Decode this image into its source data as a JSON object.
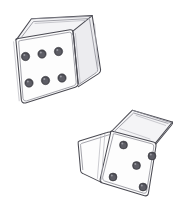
{
  "artwork": {
    "title": "Two Dice Pencil Sketch",
    "medium": "pencil-sketch",
    "background_color": "#ffffff",
    "ink_color": "#4a4a52",
    "soft_ink_color": "#8d8d96",
    "pip_color": "#4b4b52",
    "width": 185,
    "height": 222
  },
  "dice": [
    {
      "id": "die-upper-left",
      "value_shown": 6,
      "face_label": "six",
      "pip_layout": "two-rows-of-three",
      "front_face_fill": "#fdfdfd",
      "top_face_fill": "#f4f4f6",
      "side_face_fill": "#ececef",
      "front_outline": "14,40 72,30 78,86 22,103",
      "top_outline": "14,40 30,18 92,15 72,30",
      "side_outline": "72,30 92,15 100,70 78,86",
      "pips": [
        {
          "cx": 25.5,
          "cy": 56.5,
          "r": 4.2
        },
        {
          "cx": 42.0,
          "cy": 54.0,
          "r": 4.2
        },
        {
          "cx": 58.5,
          "cy": 51.5,
          "r": 4.2
        },
        {
          "cx": 29.0,
          "cy": 83.0,
          "r": 4.2
        },
        {
          "cx": 45.5,
          "cy": 80.5,
          "r": 4.2
        },
        {
          "cx": 62.0,
          "cy": 78.0,
          "r": 4.2
        }
      ]
    },
    {
      "id": "die-lower-right",
      "value_shown": 5,
      "face_label": "five",
      "pip_layout": "four-corners-plus-center",
      "front_face_fill": "#fdfdfd",
      "top_face_fill": "#f4f4f6",
      "side_face_fill": "#fbfbfc",
      "front_outline": "110,132 155,143 147,196 100,182",
      "top_outline": "110,132 132,110 172,122 155,143",
      "side_outline": "78,141 110,132 100,182 80,172",
      "pips": [
        {
          "cx": 123.5,
          "cy": 145.0,
          "r": 4.0
        },
        {
          "cx": 152.0,
          "cy": 156.0,
          "r": 4.0
        },
        {
          "cx": 136.5,
          "cy": 165.5,
          "r": 4.0
        },
        {
          "cx": 113.0,
          "cy": 177.0,
          "r": 4.0
        },
        {
          "cx": 143.0,
          "cy": 187.0,
          "r": 4.0
        }
      ]
    }
  ],
  "summary": {
    "dice_count": 2,
    "total_pips": 11,
    "values": "6 and 5"
  }
}
